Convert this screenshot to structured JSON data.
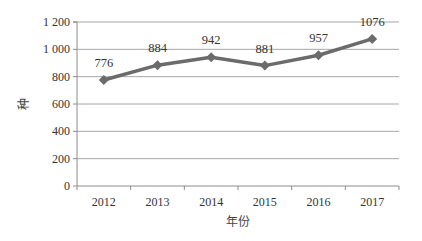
{
  "chart_data": {
    "type": "line",
    "title": "",
    "xlabel": "年份",
    "ylabel": "种",
    "categories": [
      "2012",
      "2013",
      "2014",
      "2015",
      "2016",
      "2017"
    ],
    "series": [
      {
        "name": "种数",
        "values": [
          776,
          884,
          942,
          881,
          957,
          1076
        ],
        "color": "#6b6b6b",
        "marker": "diamond"
      }
    ],
    "data_labels": [
      "776",
      "884",
      "942",
      "881",
      "957",
      "1076"
    ],
    "y_ticks": [
      0,
      200,
      400,
      600,
      800,
      1000,
      1200
    ],
    "y_tick_labels": [
      "0",
      "200",
      "400",
      "600",
      "800",
      "1 000",
      "1 200"
    ],
    "ylim": [
      0,
      1200
    ],
    "grid": true,
    "legend": "none"
  },
  "colors": {
    "line": "#6b6b6b",
    "grid": "#a6a6a6",
    "axis": "#8c8c8c",
    "text": "#333333"
  }
}
